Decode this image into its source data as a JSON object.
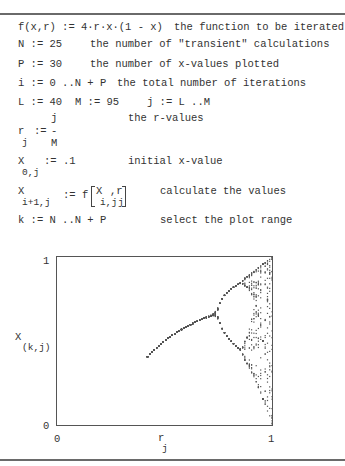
{
  "doc": {
    "lines": {
      "f_def": "f(x,r) := 4·r·x·(1 - x)",
      "f_comment": "the function to be iterated",
      "n_def": "N := 25",
      "n_comment": "the number of \"transient\" calculations",
      "p_def": "P := 30",
      "p_comment": "the number of x-values plotted",
      "i_def": "i := 0 ..N + P",
      "i_comment": "the total number of iterations",
      "l_def": "L := 40",
      "m_def": "M := 95",
      "j_def": "j := L ..M",
      "r_num": "j",
      "r_lhs": "r",
      "r_sub": "j",
      "r_assign": ":=",
      "r_bar": "-",
      "r_den": "M",
      "r_comment": "the r-values",
      "x0_lhs": "X",
      "x0_sub": "0,j",
      "x0_rhs": ":= .1",
      "x0_comment": "initial x-value",
      "xi_lhs": "X",
      "xi_sub": "i+1,j",
      "xi_rhs": ":= f",
      "xi_arg1": "X",
      "xi_arg1_sub": "i,j",
      "xi_comma": ",r",
      "xi_arg2_sub": "j",
      "xi_comment": "calculate the values",
      "k_def": "k := N ..N + P",
      "k_comment": "select the plot range"
    }
  },
  "chart_data": {
    "type": "scatter",
    "title": "",
    "xlabel": "r_j",
    "ylabel": "X_(k,j)",
    "xlabel_main": "r",
    "xlabel_sub": "j",
    "ylabel_main": "X",
    "ylabel_sub": "(k,j)",
    "xlim": [
      0,
      1
    ],
    "ylim": [
      0,
      1
    ],
    "x_ticks": [
      "0",
      "1"
    ],
    "y_ticks": [
      "0",
      "1"
    ],
    "grid": false,
    "legend": null,
    "params": {
      "L": 40,
      "M": 95,
      "N": 25,
      "P": 30,
      "x0": 0.1
    },
    "point_color": "#555555"
  }
}
